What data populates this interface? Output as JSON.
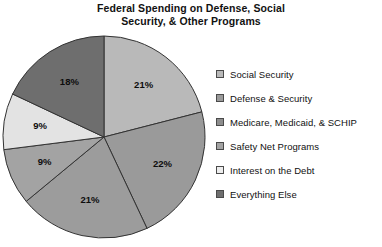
{
  "chart_data": {
    "type": "pie",
    "title": "Federal Spending on Defense, Social Security, & Other Programs",
    "title_line1": "Federal Spending on Defense, Social",
    "title_line2": "Security, & Other Programs",
    "categories": [
      "Social Security",
      "Defense & Security",
      "Medicare, Medicaid, & SCHIP",
      "Safety Net Programs",
      "Interest on the Debt",
      "Everything Else"
    ],
    "values": [
      21,
      22,
      21,
      9,
      9,
      18
    ],
    "value_labels": [
      "21%",
      "22%",
      "21%",
      "9%",
      "9%",
      "18%"
    ],
    "colors": [
      "#b9b9b9",
      "#9a9a9a",
      "#9c9c9c",
      "#a3a3a3",
      "#e3e3e3",
      "#6e6e6e"
    ],
    "slice_border_color": "#333333",
    "start_angle_deg": 0,
    "direction": "clockwise",
    "legend_position": "right",
    "grid": false,
    "xlabel": "",
    "ylabel": ""
  },
  "legend": {
    "items": [
      {
        "label": "Social Security",
        "swatch": "#b9b9b9"
      },
      {
        "label": "Defense & Security",
        "swatch": "#9a9a9a"
      },
      {
        "label": "Medicare, Medicaid, & SCHIP",
        "swatch": "#8d8d8d"
      },
      {
        "label": "Safety Net Programs",
        "swatch": "#a3a3a3"
      },
      {
        "label": "Interest on the Debt",
        "swatch": "#ededed"
      },
      {
        "label": "Everything Else",
        "swatch": "#6e6e6e"
      }
    ]
  }
}
